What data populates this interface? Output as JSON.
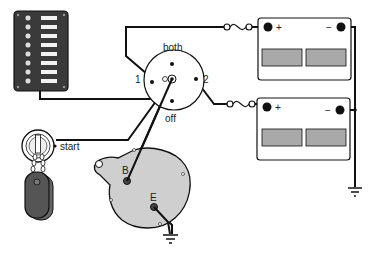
{
  "diagram": {
    "type": "marine dual-battery wiring diagram",
    "components": {
      "switch_panel": {
        "name": "breaker panel",
        "switch_count": 8
      },
      "battery_switch": {
        "positions": {
          "top": "both",
          "left": "1",
          "right": "2",
          "bottom": "off"
        }
      },
      "battery_1": {
        "plus_label": "+",
        "minus_label": "−"
      },
      "battery_2": {
        "plus_label": "+",
        "minus_label": "−"
      },
      "ignition": {
        "label": "start"
      },
      "alternator": {
        "terminal_b": "B",
        "terminal_e": "E"
      }
    },
    "colors": {
      "line": "#111111",
      "panel": "#3a3a3a",
      "battery_cell": "#a9a9a9",
      "alternator": "#cfcfcf",
      "key_fob": "#555555"
    }
  }
}
